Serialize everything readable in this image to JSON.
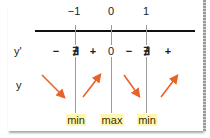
{
  "table": {
    "x_values": [
      "−1",
      "0",
      "1"
    ],
    "rows": {
      "derivative": {
        "label": "y'",
        "cells": [
          "−",
          "∄",
          "+",
          "0",
          "−",
          "∄",
          "+"
        ]
      },
      "function": {
        "label": "y",
        "arrows": [
          "down",
          "up",
          "down",
          "up"
        ]
      }
    },
    "extrema": [
      "min",
      "max",
      "min"
    ]
  },
  "colors": {
    "arrow": "#e8632a",
    "highlight": "#fff6b0",
    "axis": "#111111",
    "grid": "#9c9c9c"
  }
}
